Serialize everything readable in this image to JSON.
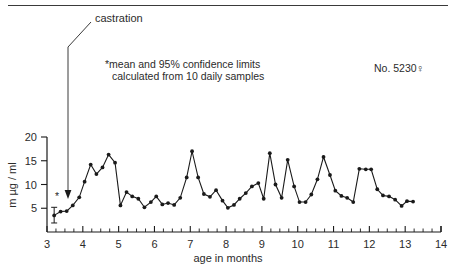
{
  "figure": {
    "top_rule": true,
    "id_label": "No. 5230♀",
    "callout_label": "castration",
    "annotation_line1": "*mean and 95% confidence limits",
    "annotation_line2": "calculated from 10 daily samples"
  },
  "chart_data": {
    "type": "line",
    "title": "",
    "subtitle": "",
    "xlabel": "age in months",
    "ylabel": "m µg / ml",
    "xlim": [
      3,
      14
    ],
    "ylim": [
      0,
      20
    ],
    "xticks": [
      3,
      4,
      5,
      6,
      7,
      8,
      9,
      10,
      11,
      12,
      13,
      14
    ],
    "xtick_labels": [
      "3",
      "4",
      "5",
      "6",
      "7",
      "8",
      "9",
      "10",
      "11",
      "12",
      "13",
      "14"
    ],
    "yticks": [
      5,
      10,
      15,
      20
    ],
    "ytick_labels": [
      "5",
      "10",
      "15",
      "20"
    ],
    "minor_tick_interval": 0.25,
    "grid": false,
    "legend": null,
    "marker": "filled-circle",
    "line_color": "#1a1a1a",
    "series": [
      {
        "name": "plasma testosterone",
        "x": [
          3.2,
          3.38,
          3.55,
          3.72,
          3.9,
          4.05,
          4.22,
          4.38,
          4.55,
          4.72,
          4.9,
          5.05,
          5.22,
          5.38,
          5.55,
          5.72,
          5.9,
          6.05,
          6.22,
          6.38,
          6.55,
          6.72,
          6.9,
          7.05,
          7.22,
          7.38,
          7.55,
          7.72,
          7.9,
          8.05,
          8.22,
          8.38,
          8.55,
          8.72,
          8.9,
          9.05,
          9.22,
          9.38,
          9.55,
          9.72,
          9.9,
          10.05,
          10.22,
          10.38,
          10.55,
          10.72,
          10.9,
          11.05,
          11.22,
          11.38,
          11.55,
          11.72,
          11.9,
          12.05,
          12.22,
          12.38,
          12.55,
          12.72,
          12.9,
          13.05,
          13.22
        ],
        "y": [
          3.5,
          4.3,
          4.4,
          5.6,
          7.3,
          10.6,
          14.2,
          12.2,
          13.6,
          16.3,
          14.6,
          5.6,
          8.4,
          7.5,
          7.0,
          5.2,
          6.3,
          7.5,
          5.8,
          6.1,
          5.7,
          7.2,
          11.5,
          17.0,
          11.5,
          8.0,
          7.4,
          8.8,
          6.6,
          5.1,
          5.7,
          7.0,
          8.2,
          9.6,
          10.3,
          7.0,
          16.6,
          10.0,
          7.2,
          15.2,
          9.6,
          6.3,
          6.3,
          7.9,
          11.1,
          15.8,
          12.0,
          8.7,
          7.6,
          7.2,
          6.3,
          13.3,
          13.2,
          13.2,
          9.0,
          7.7,
          7.5,
          6.8,
          5.5,
          6.5,
          6.4
        ]
      }
    ],
    "error_bar": {
      "x": 3.2,
      "mean": 3.5,
      "lower": 1.9,
      "upper": 5.2,
      "note": "*mean and 95% confidence limits"
    },
    "asterisk_marker": {
      "x": 3.28,
      "y": 6.7,
      "glyph": "*"
    },
    "annotations": [
      {
        "label": "castration",
        "x": 3.55,
        "type": "arrow-down"
      }
    ]
  }
}
